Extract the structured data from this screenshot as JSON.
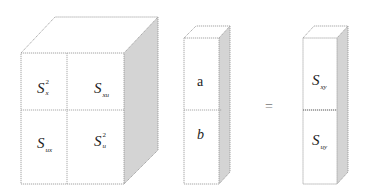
{
  "diagram": {
    "type": "matrix-equation-3d-blocks",
    "left_block": {
      "cells": [
        {
          "position": "top-left",
          "symbol": "S",
          "subscript": "x",
          "superscript": "2"
        },
        {
          "position": "top-right",
          "symbol": "S",
          "subscript": "xu",
          "superscript": ""
        },
        {
          "position": "bottom-left",
          "symbol": "S",
          "subscript": "ux",
          "superscript": ""
        },
        {
          "position": "bottom-right",
          "symbol": "S",
          "subscript": "u",
          "superscript": "2"
        }
      ]
    },
    "middle_block": {
      "cells": [
        {
          "position": "top",
          "symbol": "a",
          "italic": false
        },
        {
          "position": "bottom",
          "symbol": "b",
          "italic": true
        }
      ]
    },
    "operator": "=",
    "right_block": {
      "cells": [
        {
          "position": "top",
          "symbol": "S",
          "subscript": "xy"
        },
        {
          "position": "bottom",
          "symbol": "S",
          "subscript": "uy"
        }
      ]
    },
    "colors": {
      "edge": "#9a9a9a",
      "side_face": "#d4d4d4",
      "background": "#ffffff",
      "text": "#222222"
    }
  }
}
